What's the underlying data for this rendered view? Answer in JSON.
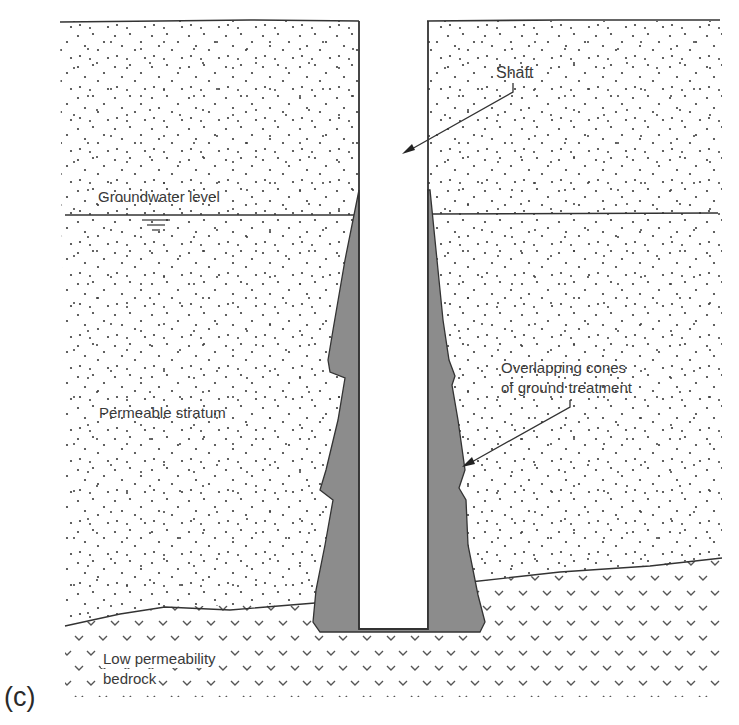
{
  "figure": {
    "panel_label": "(c)",
    "colors": {
      "line": "#333333",
      "grout": "#8c8c8c",
      "soil_dots": "#3a3a3a",
      "bedrock_hatch": "#555555",
      "background": "#ffffff"
    }
  },
  "labels": {
    "shaft": "Shaft",
    "groundwater": "Groundwater level",
    "permeable": "Permeable stratum",
    "cones_line1": "Overlapping cones",
    "cones_line2": "of ground treatment",
    "bedrock_line1": "Low permeability",
    "bedrock_line2": "bedrock"
  },
  "icons": {
    "water_table_symbol": "water-level-icon",
    "arrow_shaft": "arrow-icon",
    "arrow_cones": "arrow-icon"
  }
}
